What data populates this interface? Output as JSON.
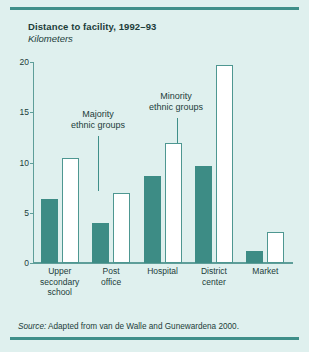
{
  "figure": {
    "title": "Distance to facility, 1992–93",
    "subtitle": "Kilometers",
    "source_label": "Source:",
    "source_text": " Adapted from van de Walle and Gunewardena 2000.",
    "colors": {
      "background": "#dff0ee",
      "rule": "#3f8f89",
      "majority_bar": "#3d8c85",
      "minority_bar": "#ffffff",
      "minority_bar_border": "#4e9791",
      "axis": "#5e9e99",
      "text": "#1c3d3a"
    }
  },
  "annotations": [
    {
      "id": "majority",
      "text": "Majority\nethnic groups"
    },
    {
      "id": "minority",
      "text": "Minority\nethnic groups"
    }
  ],
  "chart_data": {
    "type": "bar",
    "title": "Distance to facility, 1992–93",
    "subtitle": "Kilometers",
    "xlabel": "",
    "ylabel": "Kilometers",
    "ylim": [
      0,
      20
    ],
    "yticks": [
      0,
      5,
      10,
      15,
      20
    ],
    "ytick_labels": [
      "0",
      "5",
      "10",
      "15",
      "20"
    ],
    "grid": false,
    "legend": "annotated-inline",
    "categories": [
      "Upper secondary school",
      "Post office",
      "Hospital",
      "District center",
      "Market"
    ],
    "category_lines": [
      [
        "Upper",
        "secondary",
        "school"
      ],
      [
        "Post",
        "office"
      ],
      [
        "Hospital"
      ],
      [
        "District",
        "center"
      ],
      [
        "Market"
      ]
    ],
    "series": [
      {
        "name": "Majority ethnic groups",
        "color": "#3d8c85",
        "values": [
          6.4,
          4.0,
          8.7,
          9.7,
          1.2
        ]
      },
      {
        "name": "Minority ethnic groups",
        "color": "#ffffff",
        "values": [
          10.4,
          7.0,
          11.9,
          19.7,
          3.1
        ]
      }
    ]
  }
}
